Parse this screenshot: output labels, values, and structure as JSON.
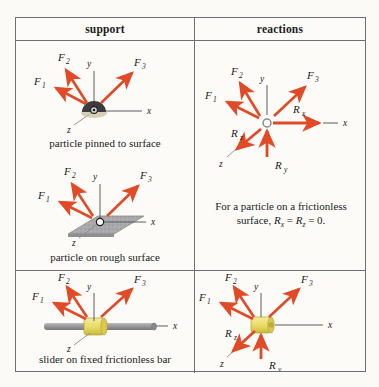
{
  "table": {
    "headers": {
      "support": "support",
      "reactions": "reactions"
    },
    "rows": [
      {
        "support_caption": "particle pinned to surface",
        "support_diagram": "particle-pinned-to-surface",
        "forces": [
          "F1",
          "F2",
          "F3"
        ],
        "axes": [
          "x",
          "y",
          "z"
        ]
      },
      {
        "support_caption": "particle on rough surface",
        "support_diagram": "particle-on-rough-surface",
        "forces": [
          "F1",
          "F2",
          "F3"
        ],
        "axes": [
          "x",
          "y",
          "z"
        ]
      },
      {
        "support_caption": "slider on fixed frictionless bar",
        "support_diagram": "slider-on-fixed-frictionless-bar",
        "forces": [
          "F1",
          "F2",
          "F3"
        ],
        "axes": [
          "x",
          "y",
          "z"
        ]
      }
    ],
    "reactions_top": {
      "forces": [
        "F1",
        "F2",
        "F3"
      ],
      "reaction_labels": [
        "Rx",
        "Ry",
        "Rz"
      ],
      "axes": [
        "x",
        "y",
        "z"
      ],
      "note_line1": "For a particle on a frictionless",
      "note_line2": "surface, Rₓ = R₂ = 0."
    },
    "reactions_bottom": {
      "forces": [
        "F1",
        "F2",
        "F3"
      ],
      "reaction_labels": [
        "Ry",
        "Rz"
      ],
      "axes": [
        "x",
        "y",
        "z"
      ]
    }
  },
  "labels": {
    "F": "F",
    "R": "R",
    "one": "1",
    "two": "2",
    "three": "3",
    "x": "x",
    "y": "y",
    "z": "z",
    "sub_x": "x",
    "sub_y": "y",
    "sub_z": "z"
  },
  "note": {
    "line1": "For a particle on a frictionless",
    "line2_pre": "surface, ",
    "line2_R1": "R",
    "line2_sub1": "x",
    "line2_eq1": " = ",
    "line2_R2": "R",
    "line2_sub2": "z",
    "line2_eq2": " = 0."
  },
  "colors": {
    "force_arrow": "#e04a27",
    "reaction_arrow": "#e04a27",
    "axis": "#5c5c5e",
    "border": "#6d6f72",
    "bar": "#9a9a9c",
    "collar": "#ece07a",
    "surface": "#a9a9ab",
    "text": "#1b1b1b",
    "background": "#fbfaf7"
  }
}
